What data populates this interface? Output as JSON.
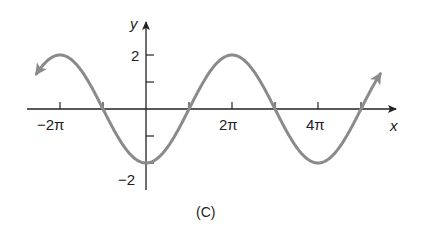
{
  "chart_data": {
    "type": "line",
    "title": "",
    "caption": "(C)",
    "xlabel": "x",
    "ylabel": "y",
    "function": "y = -2cos(x/2)",
    "x_tick_labels": [
      "−2π",
      "2π",
      "4π"
    ],
    "x_ticks": [
      "-2π",
      "-π",
      "π",
      "2π",
      "3π",
      "4π",
      "5π"
    ],
    "y_tick_labels": [
      "2",
      "−2"
    ],
    "y_ticks": [
      -2,
      -1,
      1,
      2
    ],
    "xlim": [
      "-2.7π",
      "5.9π"
    ],
    "ylim": [
      -2.2,
      3.2
    ],
    "series": [
      {
        "name": "curve",
        "x": [
          "-2π",
          "-π",
          "0",
          "π",
          "2π",
          "3π",
          "4π",
          "5π"
        ],
        "values": [
          2,
          0,
          -2,
          0,
          2,
          0,
          -2,
          0
        ]
      }
    ],
    "curve_color": "#8a8a8a"
  },
  "labels": {
    "x_axis": "x",
    "y_axis": "y",
    "tick_neg2pi": "−2π",
    "tick_2pi": "2π",
    "tick_4pi": "4π",
    "tick_y2": "2",
    "tick_yneg2": "−2",
    "caption": "(C)"
  }
}
